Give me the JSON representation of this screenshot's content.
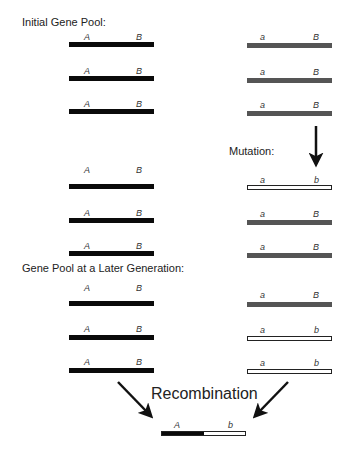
{
  "headings": {
    "initial": "Initial Gene Pool:",
    "mutation": "Mutation:",
    "later": "Gene Pool at a Later Generation:",
    "recombination": "Recombination"
  },
  "colors": {
    "black_chromosome": "#0a0a0a",
    "gray_chromosome": "#555555",
    "white_chromosome": "#ffffff"
  },
  "stages": [
    {
      "name": "initial",
      "left": [
        {
          "a1": "A",
          "a2": "B",
          "style": "black"
        },
        {
          "a1": "A",
          "a2": "B",
          "style": "black"
        },
        {
          "a1": "A",
          "a2": "B",
          "style": "black"
        }
      ],
      "right": [
        {
          "a1": "a",
          "a2": "B",
          "style": "gray"
        },
        {
          "a1": "a",
          "a2": "B",
          "style": "gray"
        },
        {
          "a1": "a",
          "a2": "B",
          "style": "gray"
        }
      ]
    },
    {
      "name": "after-mutation",
      "left": [
        {
          "a1": "A",
          "a2": "B",
          "style": "black"
        },
        {
          "a1": "A",
          "a2": "B",
          "style": "black"
        },
        {
          "a1": "A",
          "a2": "B",
          "style": "black"
        }
      ],
      "right": [
        {
          "a1": "a",
          "a2": "b",
          "style": "white"
        },
        {
          "a1": "a",
          "a2": "B",
          "style": "gray"
        },
        {
          "a1": "a",
          "a2": "B",
          "style": "gray"
        }
      ]
    },
    {
      "name": "later-generation",
      "left": [
        {
          "a1": "A",
          "a2": "B",
          "style": "black"
        },
        {
          "a1": "A",
          "a2": "B",
          "style": "black"
        },
        {
          "a1": "A",
          "a2": "B",
          "style": "black"
        }
      ],
      "right": [
        {
          "a1": "a",
          "a2": "B",
          "style": "gray"
        },
        {
          "a1": "a",
          "a2": "b",
          "style": "white"
        },
        {
          "a1": "a",
          "a2": "b",
          "style": "white"
        }
      ]
    }
  ],
  "recombinant": {
    "a1": "A",
    "a2": "b",
    "style": "half-black-half-white"
  }
}
